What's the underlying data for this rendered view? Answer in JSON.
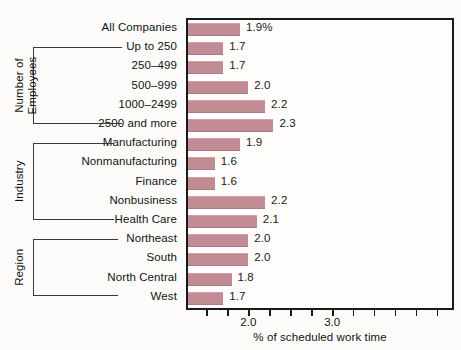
{
  "chart_data": {
    "type": "bar",
    "orientation": "horizontal",
    "title": "",
    "xlabel": "% of scheduled work time",
    "ylabel": "",
    "xlim": [
      1.28,
      4.43
    ],
    "xticks": [
      2.0,
      3.0
    ],
    "xtick_labels": [
      "2.0",
      "3.0"
    ],
    "minor_tick_step": 0.25,
    "grid": false,
    "legend": null,
    "bar_color": "#c18c93",
    "categories": [
      "All Companies",
      "Up to 250",
      "250–499",
      "500–999",
      "1000–2499",
      "2500 and more",
      "Manufacturing",
      "Nonmanufacturing",
      "Finance",
      "Nonbusiness",
      "Health Care",
      "Northeast",
      "South",
      "North Central",
      "West"
    ],
    "values": [
      1.9,
      1.7,
      1.7,
      2.0,
      2.2,
      2.3,
      1.9,
      1.6,
      1.6,
      2.2,
      2.1,
      2.0,
      2.0,
      1.8,
      1.7
    ],
    "value_labels": [
      "1.9%",
      "1.7",
      "1.7",
      "2.0",
      "2.2",
      "2.3",
      "1.9",
      "1.6",
      "1.6",
      "2.2",
      "2.1",
      "2.0",
      "2.0",
      "1.8",
      "1.7"
    ],
    "groups": [
      {
        "label": "Number of\nEmployees",
        "first_index": 1,
        "last_index": 5
      },
      {
        "label": "Industry",
        "first_index": 6,
        "last_index": 10
      },
      {
        "label": "Region",
        "first_index": 11,
        "last_index": 14
      }
    ]
  },
  "axis": {
    "title": "% of scheduled work time",
    "tick_labels": [
      "2.0",
      "3.0"
    ]
  },
  "groups": {
    "employees_line1": "Number of",
    "employees_line2": "Employees",
    "industry": "Industry",
    "region": "Region"
  }
}
